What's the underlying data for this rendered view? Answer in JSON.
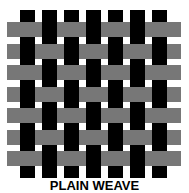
{
  "diagram": {
    "title": "PLAIN WEAVE",
    "colors": {
      "background": "#ffffff",
      "warp": "#000000",
      "weft": "#777777",
      "label": "#000000"
    },
    "warp": {
      "count": 7,
      "x_positions": [
        20,
        42,
        64,
        86,
        108,
        130,
        152
      ],
      "width": 15,
      "top": 10,
      "bottom": 178
    },
    "weft": {
      "count": 7,
      "y_positions": [
        22,
        44,
        65,
        87,
        108,
        130,
        151
      ],
      "height": 15,
      "left": 7,
      "right": 181
    },
    "pattern": "alternating over-under (checkerboard interlacing)"
  }
}
